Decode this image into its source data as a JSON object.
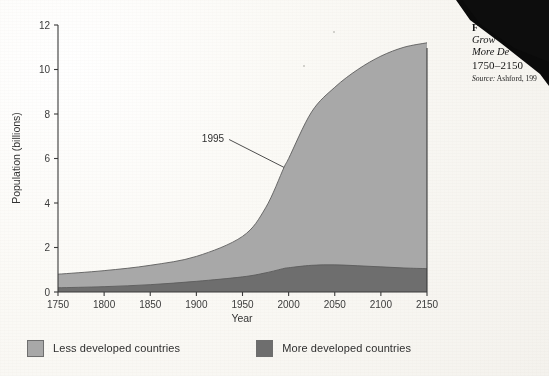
{
  "figure": {
    "caption_number": "F",
    "caption_line1": "Grow",
    "caption_line2": "More De",
    "caption_line3": "1750–2150",
    "caption_source_label": "Source:",
    "caption_source_text": " Ashford, 199"
  },
  "legend": {
    "position": "below-plot",
    "items": [
      {
        "label": "Less developed countries",
        "color": "#a8a8a8"
      },
      {
        "label": "More developed countries",
        "color": "#6e6e6e"
      }
    ]
  },
  "annotation": {
    "label": "1995"
  },
  "chart_data": {
    "type": "area",
    "stacked": true,
    "title": "",
    "xlabel": "Year",
    "ylabel": "Population (billions)",
    "xlim": [
      1750,
      2150
    ],
    "ylim": [
      0,
      12
    ],
    "xticks": [
      1750,
      1800,
      1850,
      1900,
      1950,
      2000,
      2050,
      2100,
      2150
    ],
    "yticks": [
      0,
      2,
      4,
      6,
      8,
      10,
      12
    ],
    "grid": false,
    "legend_position": "bottom-left",
    "x": [
      1750,
      1800,
      1850,
      1900,
      1950,
      1975,
      1995,
      2000,
      2025,
      2050,
      2075,
      2100,
      2125,
      2150
    ],
    "series": [
      {
        "name": "More developed countries",
        "color": "#6e6e6e",
        "values": [
          0.19,
          0.24,
          0.33,
          0.48,
          0.68,
          0.86,
          1.06,
          1.09,
          1.2,
          1.22,
          1.18,
          1.13,
          1.08,
          1.05
        ]
      },
      {
        "name": "Less developed countries",
        "color": "#a8a8a8",
        "values": [
          0.61,
          0.72,
          0.87,
          1.12,
          1.82,
          2.92,
          4.54,
          4.91,
          6.9,
          7.98,
          8.82,
          9.47,
          9.92,
          10.15
        ]
      }
    ],
    "totals": [
      0.8,
      0.96,
      1.2,
      1.6,
      2.5,
      3.78,
      5.6,
      6.0,
      8.1,
      9.2,
      10.0,
      10.6,
      11.0,
      11.2
    ],
    "annotations": [
      {
        "text": "1995",
        "x": 1995,
        "y": 5.6,
        "label_x": 1930,
        "label_y": 6.9
      }
    ]
  }
}
